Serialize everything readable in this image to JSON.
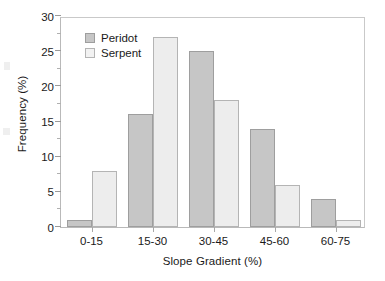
{
  "chart_data": {
    "type": "bar",
    "title": "",
    "xlabel": "Slope Gradient (%)",
    "ylabel": "Frequency (%)",
    "categories": [
      "0-15",
      "15-30",
      "30-45",
      "45-60",
      "60-75"
    ],
    "series": [
      {
        "name": "Peridot",
        "values": [
          1,
          16,
          25,
          14,
          4
        ],
        "color": "#c6c6c6"
      },
      {
        "name": "Serpent",
        "values": [
          8,
          27,
          18,
          6,
          1
        ],
        "color": "#ededed"
      }
    ],
    "ylim": [
      0,
      30
    ],
    "yticks": [
      0,
      5,
      10,
      15,
      20,
      25,
      30
    ],
    "ytick_labels": [
      "0",
      "5",
      "10",
      "15",
      "20",
      "25",
      "30"
    ],
    "yminor_ticks": [
      2.5,
      7.5,
      12.5,
      17.5,
      22.5,
      27.5
    ],
    "grid": false,
    "legend_position": "top-left",
    "legend": [
      "Peridot",
      "Serpent"
    ]
  }
}
